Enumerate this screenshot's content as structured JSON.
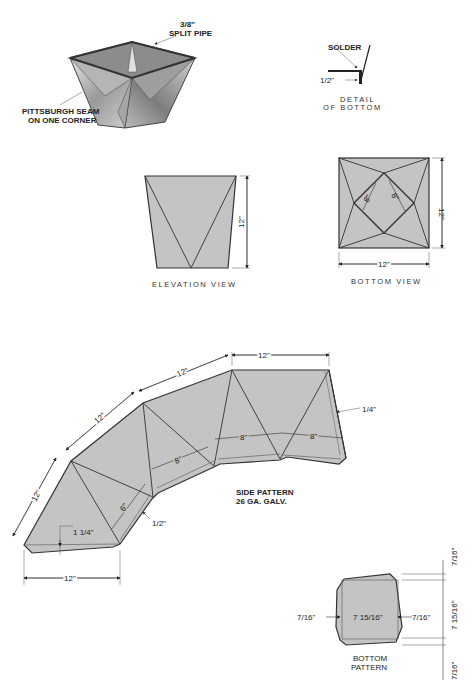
{
  "colors": {
    "fill": "#c4c4c4",
    "stroke": "#333333",
    "background": "#ffffff"
  },
  "isometric": {
    "callout_top_line1": "3/8\"",
    "callout_top_line2": "SPLIT PIPE",
    "callout_left_line1": "PITTSBURGH SEAM",
    "callout_left_line2": "ON ONE CORNER"
  },
  "detail": {
    "solder": "SOLDER",
    "half_inch": "1/2\"",
    "caption_line1": "DETAIL",
    "caption_line2": "OF BOTTOM"
  },
  "elevation": {
    "height_dim": "12\"",
    "caption": "ELEVATION VIEW"
  },
  "bottom_view": {
    "inner_dim_a": "8\"",
    "inner_dim_b": "8\"",
    "height_dim": "12\"",
    "width_dim": "12\"",
    "caption": "BOTTOM VIEW"
  },
  "side_pattern": {
    "top_dim_1": "12\"",
    "top_dim_2": "12\"",
    "top_dim_3": "12\"",
    "left_dim": "12\"",
    "bottom_dim": "12\"",
    "inner_dim_1": "8\"",
    "inner_dim_2": "8\"",
    "inner_dim_3": "8\"",
    "inner_dim_4": "6\"",
    "hem_right": "1/4\"",
    "hem_lower": "1/2\"",
    "hem_bottom": "1 1/4\"",
    "caption_line1": "SIDE PATTERN",
    "caption_line2": "26 GA. GALV."
  },
  "bottom_pattern": {
    "left_margin": "7/16\"",
    "center": "7 15/16\"",
    "right_margin": "7/16\"",
    "v_top": "7/16\"",
    "v_center": "7 15/16\"",
    "v_bottom": "7/16\"",
    "caption_line1": "BOTTOM",
    "caption_line2": "PATTERN"
  }
}
